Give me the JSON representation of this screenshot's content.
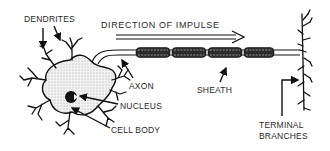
{
  "diagram": {
    "labels": {
      "dendrites": "DENDRITES",
      "direction": "DIRECTION OF IMPULSE",
      "axon": "AXON",
      "nucleus": "NUCLEUS",
      "cell_body": "CELL BODY",
      "sheath": "SHEATH",
      "terminal_line1": "TERMINAL",
      "terminal_line2": "BRANCHES"
    },
    "colors": {
      "ink": "#111111",
      "text": "#2a2a2a",
      "stipple": "#cfcfcf",
      "background": "#ffffff"
    }
  }
}
